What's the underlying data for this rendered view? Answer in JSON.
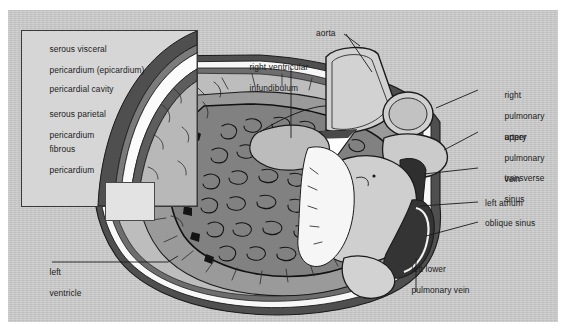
{
  "figure": {
    "panel_bg": "#c9c9c9",
    "ink": "#1b1b1b",
    "myocardium_fill": "#8f8f8f",
    "trabeculae_fill": "#7a7a7a",
    "cavity_fill": "#f4f4f4",
    "fibrous_fill": "#5a5a5a"
  },
  "inset": {
    "caption": "magnified pericardial layers",
    "labels": [
      {
        "id": "serous-visceral-pericardium",
        "line1": "serous visceral",
        "line2": "pericardium (epicardium)"
      },
      {
        "id": "pericardial-cavity",
        "line1": "pericardial cavity",
        "line2": ""
      },
      {
        "id": "serous-parietal-pericardium",
        "line1": "serous parietal",
        "line2": "pericardium"
      },
      {
        "id": "fibrous-pericardium",
        "line1": "fibrous",
        "line2": "pericardium"
      }
    ]
  },
  "labels": {
    "aorta": "aorta",
    "right_ventricular_infundibulum_l1": "right ventricular",
    "right_ventricular_infundibulum_l2": "infundibulum",
    "right_pulmonary_artery_l1": "right",
    "right_pulmonary_artery_l2": "pulmonary",
    "right_pulmonary_artery_l3": "artery",
    "upper_pulmonary_vein_l1": "upper",
    "upper_pulmonary_vein_l2": "pulmonary",
    "upper_pulmonary_vein_l3": "vein",
    "transverse_sinus_l1": "transverse",
    "transverse_sinus_l2": "sinus",
    "left_atrium": "left atrium",
    "oblique_sinus": "oblique sinus",
    "left_ventricle_l1": "left",
    "left_ventricle_l2": "ventricle",
    "left_lower_pulmonary_vein_l1": "left lower",
    "left_lower_pulmonary_vein_l2": "pulmonary vein"
  }
}
